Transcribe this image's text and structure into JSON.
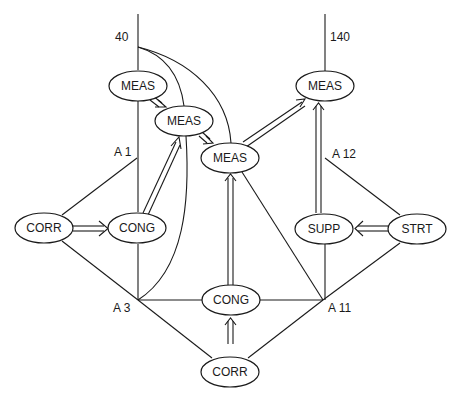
{
  "diagram": {
    "labels": {
      "top_left": "40",
      "top_right": "140",
      "a1": "A 1",
      "a3": "A 3",
      "a11": "A 11",
      "a12": "A 12"
    },
    "nodes": {
      "meas_1": "MEAS",
      "meas_2": "MEAS",
      "meas_3": "MEAS",
      "meas_4": "MEAS",
      "corr_left": "CORR",
      "cong_left": "CONG",
      "cong_center": "CONG",
      "corr_bottom": "CORR",
      "supp": "SUPP",
      "strt": "STRT"
    },
    "colors": {
      "stroke": "#1a1a1a",
      "background": "#ffffff"
    }
  }
}
